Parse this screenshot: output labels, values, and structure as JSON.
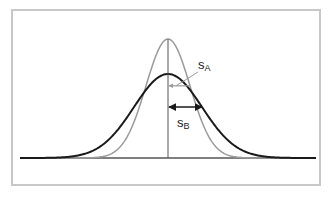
{
  "diagram": {
    "title": "",
    "colors": {
      "frame": "#c8c8c8",
      "baseline": "#555555",
      "curve_a": "#9a9a9a",
      "curve_b": "#1a1a1a",
      "mean_line": "#555555"
    },
    "layout": {
      "baseline_y": 158,
      "baseline_x_start": 20,
      "baseline_x_end": 316,
      "mean_x": 168
    },
    "curves": [
      {
        "name": "A",
        "peak_y": 39,
        "sigma_px": 22,
        "color_key": "curve_a",
        "stroke_width": 1.5
      },
      {
        "name": "B",
        "peak_y": 74,
        "sigma_px": 34,
        "color_key": "curve_b",
        "stroke_width": 2
      }
    ],
    "labels": {
      "s_a": {
        "main": "s",
        "sub": "A"
      },
      "s_b": {
        "main": "s",
        "sub": "B"
      }
    }
  }
}
